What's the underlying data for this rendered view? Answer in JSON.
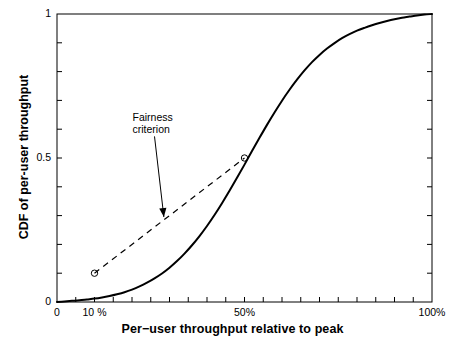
{
  "chart_data": {
    "type": "line",
    "title": "",
    "xlabel": "Per−user throughput relative to peak",
    "ylabel": "CDF of per-user throughput",
    "xlim": [
      0,
      100
    ],
    "ylim": [
      0,
      1
    ],
    "grid": false,
    "legend": "none",
    "x_tick_labels": [
      {
        "value": 0,
        "text": "0"
      },
      {
        "value": 10,
        "text": "10 %"
      },
      {
        "value": 50,
        "text": "50%"
      },
      {
        "value": 100,
        "text": "100%"
      }
    ],
    "x_minor_tick_values": [
      5,
      10,
      15,
      20,
      25,
      30,
      35,
      40,
      45,
      50,
      55,
      60,
      65,
      70,
      75,
      80,
      85,
      90,
      95
    ],
    "y_tick_labels": [
      {
        "value": 0,
        "text": "0"
      },
      {
        "value": 0.5,
        "text": "0.5"
      },
      {
        "value": 1,
        "text": "1"
      }
    ],
    "y_minor_tick_values": [
      0.1,
      0.2,
      0.3,
      0.4,
      0.5,
      0.6,
      0.7,
      0.8,
      0.9
    ],
    "series": [
      {
        "name": "CDF of per-user throughput",
        "style": "solid",
        "color": "#000000",
        "x": [
          0,
          2,
          4,
          6,
          8,
          10,
          12,
          14,
          16,
          18,
          20,
          22,
          24,
          26,
          28,
          30,
          32,
          34,
          36,
          38,
          40,
          42,
          44,
          46,
          48,
          50,
          52,
          54,
          56,
          58,
          60,
          62,
          64,
          66,
          68,
          70,
          72,
          74,
          76,
          78,
          80,
          82,
          84,
          86,
          88,
          90,
          92,
          94,
          96,
          98,
          100
        ],
        "y": [
          0.0,
          0.002,
          0.004,
          0.006,
          0.009,
          0.012,
          0.016,
          0.021,
          0.027,
          0.034,
          0.043,
          0.054,
          0.067,
          0.082,
          0.099,
          0.119,
          0.142,
          0.168,
          0.197,
          0.229,
          0.264,
          0.302,
          0.343,
          0.386,
          0.431,
          0.477,
          0.524,
          0.57,
          0.615,
          0.658,
          0.699,
          0.737,
          0.772,
          0.804,
          0.833,
          0.858,
          0.88,
          0.899,
          0.916,
          0.93,
          0.942,
          0.952,
          0.961,
          0.969,
          0.976,
          0.982,
          0.987,
          0.991,
          0.995,
          0.998,
          1.0
        ]
      },
      {
        "name": "Fairness criterion",
        "style": "dashed",
        "color": "#000000",
        "marker": "circle",
        "x": [
          10,
          50
        ],
        "y": [
          0.1,
          0.5
        ]
      }
    ],
    "annotations": [
      {
        "text_line1": "Fairness",
        "text_line2": "criterion",
        "text_x": 26,
        "text_y": 0.62,
        "arrow_from_x": 26,
        "arrow_from_y": 0.575,
        "arrow_to_x": 28.5,
        "arrow_to_y": 0.295
      }
    ]
  }
}
